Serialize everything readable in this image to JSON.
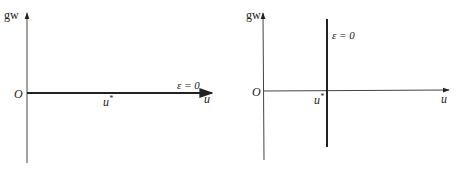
{
  "figures": [
    {
      "id": "left",
      "y_axis_label": "gw",
      "x_axis_label": "u",
      "origin_label": "O",
      "curve_label": "ε = 0",
      "marker_label": "u",
      "marker_sup": "*",
      "description": "ε = 0 line coincides with the u-axis"
    },
    {
      "id": "right",
      "y_axis_label": "gw",
      "x_axis_label": "u",
      "origin_label": "O",
      "curve_label": "ε = 0",
      "marker_label": "u",
      "marker_sup": "*",
      "description": "ε = 0 line is vertical at u = u*"
    }
  ],
  "colors": {
    "axis": "#333333",
    "line": "#222222",
    "background": "#ffffff"
  }
}
